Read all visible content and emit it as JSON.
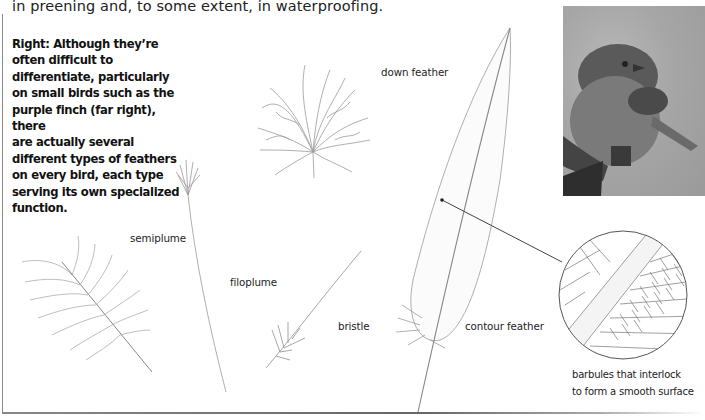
{
  "intro_text": "in preening and, to some extent, in waterproofing.",
  "caption": {
    "lines": [
      "Right: Although they’re",
      "often difficult to",
      "differentiate, particularly",
      "on small birds such as the",
      "purple finch (far right), there",
      "are actually several",
      "different types of feathers",
      "on every bird, each type",
      "serving its own specialized",
      "function."
    ]
  },
  "labels": {
    "down_feather": "down feather",
    "semiplume": "semiplume",
    "filoplume": "filoplume",
    "bristle": "bristle",
    "contour_feather": "contour feather",
    "barbules_line1": "barbules that interlock",
    "barbules_line2": "to form a smooth surface"
  },
  "photo": {
    "subject": "purple finch",
    "style": "grayscale"
  },
  "illustrations": [
    {
      "name": "down feather"
    },
    {
      "name": "semiplume"
    },
    {
      "name": "filoplume"
    },
    {
      "name": "bristle"
    },
    {
      "name": "contour feather"
    },
    {
      "name": "barbules magnified detail"
    }
  ],
  "colors": {
    "text": "#1a1a1a",
    "line_art": "#9a9a9a",
    "frame": "#8a8a8a"
  }
}
